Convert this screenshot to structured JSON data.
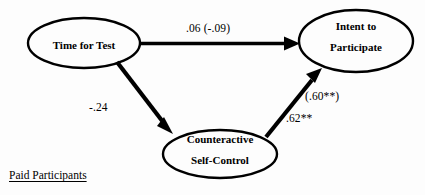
{
  "figure": {
    "caption": "Paid Participants",
    "colors": {
      "stroke": "#000000",
      "background": "#ffffff",
      "text": "#000000"
    }
  },
  "nodes": [
    {
      "id": "time-for-test",
      "label_line1": "Time for Test",
      "label_line2": "",
      "cx": 84,
      "cy": 43,
      "rx": 56,
      "ry": 25
    },
    {
      "id": "intent-to-participate",
      "label_line1": "Intent to",
      "label_line2": "Participate",
      "cx": 356,
      "cy": 41,
      "rx": 57,
      "ry": 31
    },
    {
      "id": "counteractive-self-control",
      "label_line1": "Counteractive",
      "label_line2": "Self-Control",
      "cx": 220,
      "cy": 154,
      "rx": 57,
      "ry": 24
    }
  ],
  "edges": [
    {
      "id": "time-to-intent",
      "from": "time-for-test",
      "to": "intent-to-participate",
      "label": ".06   (-.09)",
      "coefficient": ".06",
      "coefficient_parenthetical": "(-.09)"
    },
    {
      "id": "time-to-counteractive",
      "from": "time-for-test",
      "to": "counteractive-self-control",
      "label": "-.24",
      "coefficient": "-.24",
      "coefficient_parenthetical": ""
    },
    {
      "id": "counteractive-to-intent",
      "from": "counteractive-self-control",
      "to": "intent-to-participate",
      "label": ".62**",
      "coefficient": ".62**",
      "coefficient_parenthetical": "(.60**)"
    }
  ],
  "labels": {
    "top_path": ".06   (-.09)",
    "left_path": "-.24",
    "right_path_parenthetical": "(.60**)",
    "right_path": ".62**"
  }
}
